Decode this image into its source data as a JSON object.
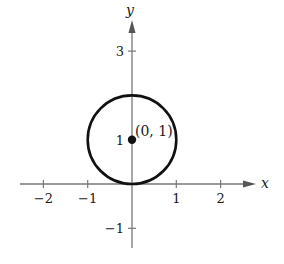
{
  "chart_data": {
    "type": "scatter",
    "title": "",
    "xlabel": "x",
    "ylabel": "y",
    "xlim": [
      -2.5,
      2.8
    ],
    "ylim": [
      -1.5,
      3.7
    ],
    "grid": false,
    "x_ticks": [
      {
        "value": -2,
        "label": "−2"
      },
      {
        "value": -1,
        "label": "−1"
      },
      {
        "value": 1,
        "label": "1"
      },
      {
        "value": 2,
        "label": "2"
      }
    ],
    "y_ticks": [
      {
        "value": 3,
        "label": "3"
      },
      {
        "value": 1,
        "label": "1"
      },
      {
        "value": -1,
        "label": "−1"
      }
    ],
    "shapes": [
      {
        "kind": "circle",
        "center": [
          0,
          1
        ],
        "radius": 1,
        "equation": "x^2 + (y - 1)^2 = 1"
      }
    ],
    "points": [
      {
        "x": 0,
        "y": 1,
        "label": "(0, 1)"
      }
    ],
    "colors": {
      "axis": "#777777",
      "curve": "#111111",
      "point": "#111111"
    }
  }
}
